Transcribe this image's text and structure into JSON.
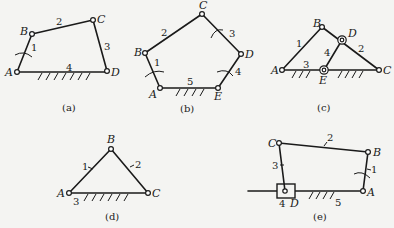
{
  "figures": {
    "a": {
      "caption": "(a)",
      "joints": {
        "A": "A",
        "B": "B",
        "C": "C",
        "D": "D"
      },
      "links": {
        "l1": "1",
        "l2": "2",
        "l3": "3",
        "l4": "4"
      }
    },
    "b": {
      "caption": "(b)",
      "joints": {
        "A": "A",
        "B": "B",
        "C": "C",
        "D": "D",
        "E": "E"
      },
      "links": {
        "l1": "1",
        "l2": "2",
        "l3": "3",
        "l4": "4",
        "l5": "5"
      }
    },
    "c": {
      "caption": "(c)",
      "joints": {
        "A": "A",
        "B": "B",
        "C": "C",
        "D": "D",
        "E": "E"
      },
      "links": {
        "l1": "1",
        "l2": "2",
        "l3": "3",
        "l4": "4"
      }
    },
    "d": {
      "caption": "(d)",
      "joints": {
        "A": "A",
        "B": "B",
        "C": "C"
      },
      "links": {
        "l1": "1",
        "l2": "2",
        "l3": "3"
      }
    },
    "e": {
      "caption": "(e)",
      "joints": {
        "A": "A",
        "B": "B",
        "C": "C",
        "D": "D"
      },
      "links": {
        "l1": "1",
        "l2": "2",
        "l3": "3",
        "l4": "4",
        "l5": "5"
      }
    }
  }
}
